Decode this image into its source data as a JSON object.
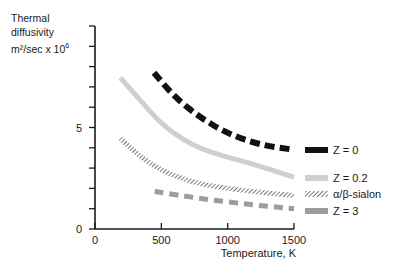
{
  "chart_data": {
    "type": "line",
    "title": "",
    "ylabel_lines": [
      "Thermal",
      "diffusivity",
      "m²/sec x 10"
    ],
    "ylabel_exponent": "6",
    "xlabel": "Temperature, K",
    "xlim": [
      0,
      1500
    ],
    "ylim": [
      0,
      10
    ],
    "x_ticks": [
      "0",
      "500",
      "1000",
      "1500"
    ],
    "y_tick_labels": [
      {
        "value": 0,
        "label": "0"
      },
      {
        "value": 5,
        "label": "5"
      }
    ],
    "y_minor_ticks": [
      0,
      1,
      2,
      3,
      4,
      5,
      6,
      7,
      8,
      9,
      10
    ],
    "grid": false,
    "legend_position": "right",
    "series": [
      {
        "name": "Z = 0",
        "style": "black-dashed-thick",
        "color": "#111111",
        "x": [
          445,
          600,
          790,
          1000,
          1240,
          1500
        ],
        "values": [
          7.7,
          6.5,
          5.5,
          4.7,
          4.15,
          3.9
        ]
      },
      {
        "name": "Z = 0.2",
        "style": "light-gray-solid-thick",
        "color": "#c8c8c8",
        "x": [
          190,
          340,
          525,
          790,
          1170,
          1500
        ],
        "values": [
          7.45,
          6.35,
          5.0,
          3.9,
          3.25,
          2.55
        ]
      },
      {
        "name": "α/β-sialon",
        "style": "hatched",
        "color": "#6e6e6e",
        "x": [
          190,
          415,
          715,
          1090,
          1500
        ],
        "values": [
          4.45,
          3.15,
          2.3,
          1.9,
          1.65
        ]
      },
      {
        "name": "Z = 3",
        "style": "gray-dashed",
        "color": "#9a9a9a",
        "x": [
          450,
          790,
          1170,
          1500
        ],
        "values": [
          1.85,
          1.5,
          1.2,
          1.0
        ]
      }
    ]
  }
}
